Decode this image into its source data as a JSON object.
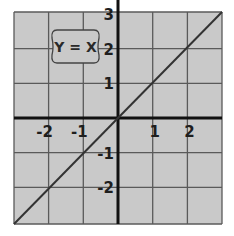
{
  "chart_data": {
    "type": "line",
    "title": "",
    "annotation": "Y = X",
    "series": [
      {
        "name": "Y = X",
        "x": [
          -3,
          -2,
          -1,
          0,
          1,
          2,
          3
        ],
        "y": [
          -3,
          -2,
          -1,
          0,
          1,
          2,
          3
        ]
      }
    ],
    "x_ticks": [
      "-2",
      "-1",
      "1",
      "2"
    ],
    "y_ticks": [
      "3",
      "2",
      "1",
      "-1",
      "-2"
    ],
    "xlabel": "",
    "ylabel": "",
    "xlim": [
      -3,
      3
    ],
    "ylim": [
      -3,
      3
    ],
    "grid": true,
    "legend": null
  },
  "colors": {
    "background": "#c9c9c9",
    "grid": "#555555",
    "axis": "#111111",
    "line": "#333333",
    "label_box_border": "#444444"
  }
}
